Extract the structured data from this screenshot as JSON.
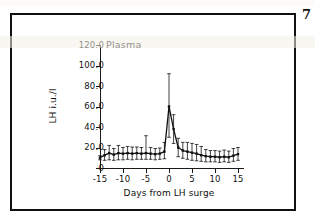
{
  "page": {
    "folio": "7",
    "background_color": "#ffffff",
    "frame_color": "#111111"
  },
  "figure": {
    "panel_title": "Plasma"
  },
  "chart_data": {
    "type": "line",
    "title": "Plasma",
    "xlabel": "Days from LH surge",
    "ylabel": "LH i.u./l",
    "xlim": [
      -15,
      15
    ],
    "ylim": [
      0,
      120
    ],
    "grid": false,
    "legend": null,
    "errorbars": true,
    "errorbar_style": "mean with capped vertical bars",
    "line_color": "#111111",
    "marker": "square",
    "ytick_labels": [
      "120.0",
      "100.0",
      "80.0",
      "60.0",
      "40.0",
      "20.0",
      "0"
    ],
    "ytick_values": [
      120,
      100,
      80,
      60,
      40,
      20,
      0
    ],
    "xtick_labels": [
      "-15",
      "-10",
      "-5",
      "0",
      "5",
      "10",
      "15"
    ],
    "xtick_values": [
      -15,
      -10,
      -5,
      0,
      5,
      10,
      15
    ],
    "x": [
      -15,
      -14,
      -13,
      -12,
      -11,
      -10,
      -9,
      -8,
      -7,
      -6,
      -5,
      -4,
      -3,
      -2,
      -1,
      0,
      1,
      2,
      3,
      4,
      5,
      6,
      7,
      8,
      9,
      10,
      11,
      12,
      13,
      14,
      15
    ],
    "series": [
      {
        "name": "Plasma LH",
        "values": [
          10.0,
          12.5,
          14.5,
          13.0,
          14.5,
          14.0,
          14.5,
          14.0,
          14.5,
          14.0,
          14.5,
          14.0,
          13.5,
          14.0,
          16.0,
          60.0,
          38.0,
          20.0,
          17.0,
          16.0,
          15.0,
          14.0,
          12.5,
          11.5,
          11.0,
          11.0,
          10.5,
          11.0,
          10.5,
          12.0,
          13.5
        ],
        "upper": [
          12.0,
          18.0,
          22.0,
          19.0,
          22.0,
          20.0,
          21.0,
          20.5,
          20.5,
          20.0,
          31.5,
          20.0,
          19.0,
          19.5,
          25.0,
          92.0,
          52.0,
          29.0,
          25.0,
          25.0,
          24.0,
          23.0,
          21.0,
          18.0,
          17.0,
          17.0,
          16.5,
          17.5,
          16.5,
          19.0,
          20.0
        ],
        "lower": [
          8.0,
          7.5,
          8.0,
          7.5,
          8.0,
          8.0,
          8.5,
          8.0,
          8.5,
          8.5,
          8.5,
          8.5,
          8.0,
          8.5,
          9.0,
          30.0,
          24.0,
          11.0,
          9.5,
          8.5,
          7.5,
          7.0,
          6.5,
          6.0,
          6.0,
          6.0,
          5.5,
          6.0,
          5.5,
          6.5,
          7.5
        ]
      }
    ]
  }
}
